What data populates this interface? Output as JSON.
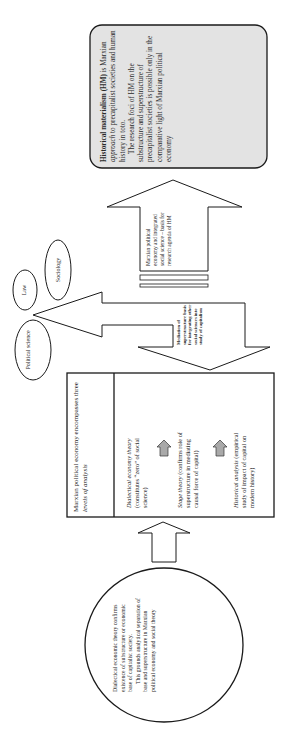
{
  "diagram": {
    "hm_box": {
      "title": "Historical materialism (HM)",
      "line1_pre": "is Marxian",
      "line1_em": "approach",
      "line1_post": "to precapitalist societies and human history in toto.",
      "para2": "The research foci of HM on the substructure and superstructure of precapitalist societies is possible only in the comparative light of Marxian political economy"
    },
    "up_arrow_text": "Marxian political economy and integrated social science – basis for research agenda of HM",
    "mediation_text": "Mediation of superstructure basis for integrating other social sciences into study of capitalism",
    "ellipses": {
      "law": "Law",
      "sociology": "Sociology",
      "political_science": "Political science"
    },
    "levels_box": {
      "header_pre": "Marxian political economy encompasses three",
      "header_em": "levels of analysis",
      "levels": [
        {
          "em": "Dialectical economy theory",
          "text": "(constitutes “zero” of social science)"
        },
        {
          "em": "Stage theory",
          "text": "(confirms role of superstructure in mediating causal force of capital)"
        },
        {
          "em": "Historical analysis",
          "text": "(empirical study of impact of capital on modern history)"
        }
      ]
    },
    "circle": {
      "para1": "Dialectical economic theory confirms existence of substructure or economic base of capitalist society.",
      "para2": "This grounds analytical separation of base and superstructure in Marxian political economy and social theory"
    },
    "colors": {
      "hm_fill": "#e3e3e3",
      "small_arrow_fill": "#a9a9a9",
      "stroke": "#1a1a1a"
    }
  }
}
